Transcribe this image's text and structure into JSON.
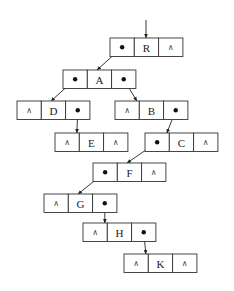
{
  "diagram": {
    "null_symbol": "∧",
    "cell_width": 24.3,
    "cell_height": 18.5,
    "entry_pointer": {
      "x": 146,
      "y1": 20,
      "y2": 38
    },
    "nodes": [
      {
        "id": "R",
        "x": 110,
        "y": 38,
        "left": "ptr",
        "right": "null"
      },
      {
        "id": "A",
        "x": 63,
        "y": 70,
        "left": "ptr",
        "right": "ptr"
      },
      {
        "id": "D",
        "x": 17,
        "y": 101,
        "left": "null",
        "right": "ptr"
      },
      {
        "id": "B",
        "x": 115,
        "y": 101,
        "left": "null",
        "right": "ptr"
      },
      {
        "id": "E",
        "x": 55,
        "y": 133,
        "left": "null",
        "right": "null"
      },
      {
        "id": "C",
        "x": 145,
        "y": 133,
        "left": "ptr",
        "right": "null"
      },
      {
        "id": "F",
        "x": 93,
        "y": 163,
        "left": "ptr",
        "right": "null"
      },
      {
        "id": "G",
        "x": 44,
        "y": 194,
        "left": "null",
        "right": "ptr"
      },
      {
        "id": "H",
        "x": 83,
        "y": 223,
        "left": "null",
        "right": "ptr"
      },
      {
        "id": "K",
        "x": 124,
        "y": 254,
        "left": "null",
        "right": "null"
      }
    ],
    "edges": [
      {
        "from": "R",
        "side": "left",
        "to": "A"
      },
      {
        "from": "A",
        "side": "left",
        "to": "D"
      },
      {
        "from": "A",
        "side": "right",
        "to": "B"
      },
      {
        "from": "D",
        "side": "right",
        "to": "E"
      },
      {
        "from": "B",
        "side": "right",
        "to": "C"
      },
      {
        "from": "C",
        "side": "left",
        "to": "F"
      },
      {
        "from": "F",
        "side": "left",
        "to": "G"
      },
      {
        "from": "G",
        "side": "right",
        "to": "H"
      },
      {
        "from": "H",
        "side": "right",
        "to": "K"
      }
    ]
  }
}
